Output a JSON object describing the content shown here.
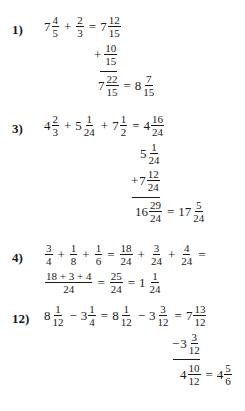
{
  "problems": [
    {
      "label": "1)",
      "line1": {
        "a": {
          "whole": "7",
          "num": "4",
          "den": "5"
        },
        "op1": "+",
        "b": {
          "whole": "",
          "num": "2",
          "den": "3"
        },
        "eq": "=",
        "c": {
          "whole": "7",
          "num": "12",
          "den": "15"
        }
      },
      "stack": {
        "addend": {
          "op": "+",
          "whole": "",
          "num": "10",
          "den": "15"
        },
        "sum": {
          "whole": "7",
          "num": "22",
          "den": "15"
        },
        "eq": "=",
        "result": {
          "whole": "8",
          "num": "7",
          "den": "15"
        }
      }
    },
    {
      "label": "3)",
      "line1": {
        "a": {
          "whole": "4",
          "num": "2",
          "den": "3"
        },
        "op1": "+",
        "b": {
          "whole": "5",
          "num": "1",
          "den": "24"
        },
        "op2": "+",
        "c": {
          "whole": "7",
          "num": "1",
          "den": "2"
        },
        "eq": "=",
        "d": {
          "whole": "4",
          "num": "16",
          "den": "24"
        }
      },
      "stack": {
        "row2": {
          "whole": "5",
          "num": "1",
          "den": "24"
        },
        "row3": {
          "op": "+",
          "whole": "7",
          "num": "12",
          "den": "24"
        },
        "sum": {
          "whole": "16",
          "num": "29",
          "den": "24"
        },
        "eq": "=",
        "result": {
          "whole": "17",
          "num": "5",
          "den": "24"
        }
      }
    },
    {
      "label": "4)",
      "line1": {
        "a": {
          "num": "3",
          "den": "4"
        },
        "op1": "+",
        "b": {
          "num": "1",
          "den": "8"
        },
        "op2": "+",
        "c": {
          "num": "1",
          "den": "6"
        },
        "eq": "=",
        "d": {
          "num": "18",
          "den": "24"
        },
        "op3": "+",
        "e": {
          "num": "3",
          "den": "24"
        },
        "op4": "+",
        "f": {
          "num": "4",
          "den": "24"
        },
        "eq2": "="
      },
      "line2": {
        "g": {
          "num": "18 + 3 + 4",
          "den": "24"
        },
        "eq": "=",
        "h": {
          "num": "25",
          "den": "24"
        },
        "eq2": "=",
        "i": {
          "whole": "1",
          "num": "1",
          "den": "24"
        }
      }
    },
    {
      "label": "12)",
      "line1": {
        "a": {
          "whole": "8",
          "num": "1",
          "den": "12"
        },
        "op1": "−",
        "b": {
          "whole": "3",
          "num": "1",
          "den": "4"
        },
        "eq": "=",
        "c": {
          "whole": "8",
          "num": "1",
          "den": "12"
        },
        "op2": "−",
        "d": {
          "whole": "3",
          "num": "3",
          "den": "12"
        },
        "eq2": "=",
        "e": {
          "whole": "7",
          "num": "13",
          "den": "12"
        }
      },
      "stack": {
        "subtrahend": {
          "op": "−",
          "whole": "3",
          "num": "3",
          "den": "12"
        },
        "diff": {
          "whole": "4",
          "num": "10",
          "den": "12"
        },
        "eq": "=",
        "result": {
          "whole": "4",
          "num": "5",
          "den": "6"
        }
      }
    }
  ]
}
